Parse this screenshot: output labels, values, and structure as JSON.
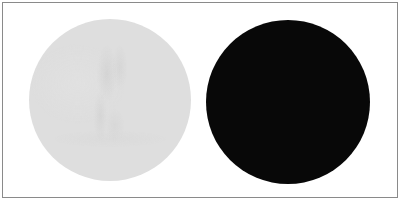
{
  "image": {
    "kind": "specimen-photograph",
    "description": "Two circular discs side by side on a white background inside a thin gray rectangular frame",
    "width": 406,
    "height": 206,
    "background_color": "#ffffff"
  },
  "frame": {
    "name": "specimen-plate-frame",
    "border_color": "#8a8a8a",
    "border_width": 1,
    "fill_color": "#ffffff",
    "left": 2,
    "top": 2,
    "width": 396,
    "height": 196
  },
  "objects": [
    {
      "name": "light-disc",
      "label": "pale gray disc",
      "shape": "circle",
      "color": "#dedede",
      "center_x": 110,
      "center_y": 100,
      "radius": 81,
      "texture": "faint mottled vertical streaks near center",
      "position": "left"
    },
    {
      "name": "dark-disc",
      "label": "solid black disc",
      "shape": "circle",
      "color": "#080808",
      "center_x": 288,
      "center_y": 102,
      "radius": 82,
      "texture": "uniform opaque black",
      "position": "right"
    }
  ]
}
